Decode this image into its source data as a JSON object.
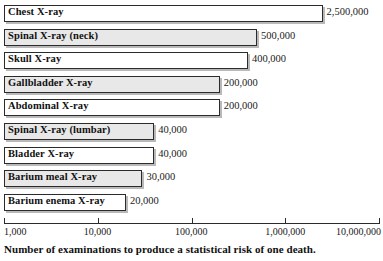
{
  "chart_data": {
    "type": "bar",
    "orientation": "horizontal",
    "title": "",
    "xlabel": "Number of examinations to produce a statistical risk of one death.",
    "ylabel": "",
    "xscale": "log",
    "xlim": [
      1000,
      10000000
    ],
    "grid": false,
    "legend": null,
    "xticks": [
      {
        "value": 1000,
        "label": "1,000"
      },
      {
        "value": 10000,
        "label": "10,000"
      },
      {
        "value": 100000,
        "label": "100,000"
      },
      {
        "value": 1000000,
        "label": "1,000,000"
      },
      {
        "value": 10000000,
        "label": "10,000,000"
      }
    ],
    "categories": [
      "Chest X-ray",
      "Spinal X-ray (neck)",
      "Skull X-ray",
      "Gallbladder X-ray",
      "Abdominal X-ray",
      "Spinal X-ray (lumbar)",
      "Bladder X-ray",
      "Barium meal X-ray",
      "Barium enema X-ray"
    ],
    "values": [
      2500000,
      500000,
      400000,
      200000,
      200000,
      40000,
      40000,
      30000,
      20000
    ],
    "value_labels": [
      "2,500,000",
      "500,000",
      "400,000",
      "200,000",
      "200,000",
      "40,000",
      "40,000",
      "30,000",
      "20,000"
    ]
  },
  "caption": {
    "text": "Number of examinations to produce a statistical risk of one death."
  },
  "style": {
    "bar_fill_light": "#ffffff",
    "bar_fill_shaded": "#e8e8e8",
    "bar_border": "#2b2b2b",
    "bar_shadow": "#b9b9b9",
    "text_color": "#1a1a1a",
    "background": "#ffffff"
  }
}
